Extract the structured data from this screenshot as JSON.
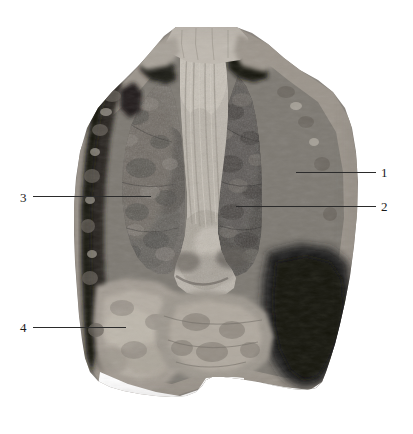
{
  "figure": {
    "kind": "anatomical-specimen-photograph",
    "tone": "grayscale",
    "width_px": 413,
    "height_px": 434,
    "background_color": "#ffffff",
    "leader_color": "#2b2b2b",
    "label_color": "#1a1a1a"
  },
  "labels": [
    {
      "id": "label-1",
      "text": "1",
      "side": "right",
      "text_x": 381,
      "text_y": 166,
      "line_x": 296,
      "line_y": 172,
      "line_w": 80
    },
    {
      "id": "label-2",
      "text": "2",
      "side": "right",
      "text_x": 381,
      "text_y": 200,
      "line_x": 236,
      "line_y": 206,
      "line_w": 140
    },
    {
      "id": "label-3",
      "text": "3",
      "side": "left",
      "text_x": 20,
      "text_y": 191,
      "line_x": 33,
      "line_y": 196,
      "line_w": 118
    },
    {
      "id": "label-4",
      "text": "4",
      "side": "left",
      "text_x": 20,
      "text_y": 321,
      "line_x": 33,
      "line_y": 327,
      "line_w": 93
    }
  ],
  "specimen": {
    "regions": [
      {
        "name": "left-lung-field",
        "tone": "#6e6a66"
      },
      {
        "name": "right-lung-field",
        "tone": "#5c5955"
      },
      {
        "name": "mediastinum-center",
        "tone": "#b8b2aa"
      },
      {
        "name": "diaphragm-lower-left",
        "tone": "#9a948c"
      },
      {
        "name": "pleural-shadow-right",
        "tone": "#221f1d"
      },
      {
        "name": "chest-wall-rim",
        "tone": "#8e8880"
      }
    ]
  }
}
